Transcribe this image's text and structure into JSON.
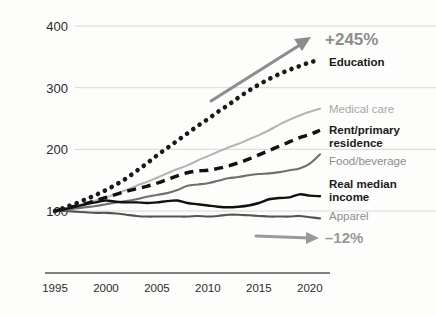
{
  "chart_data": {
    "type": "line",
    "title": "",
    "subtitle": "",
    "xlabel": "",
    "ylabel": "",
    "xlim": [
      1994,
      2022
    ],
    "ylim": [
      60,
      420
    ],
    "xticks": [
      1995,
      2000,
      2005,
      2010,
      2015,
      2020
    ],
    "xtick_labels": [
      "1995",
      "2000",
      "2005",
      "2010",
      "2015",
      "2020"
    ],
    "yticks": [
      100,
      200,
      300,
      400
    ],
    "ytick_labels": [
      "100",
      "200",
      "300",
      "400"
    ],
    "grid": "horizontal",
    "legend_position": "right-inline",
    "index_base": 100,
    "x": [
      1995,
      1996,
      1997,
      1998,
      1999,
      2000,
      2001,
      2002,
      2003,
      2004,
      2005,
      2006,
      2007,
      2008,
      2009,
      2010,
      2011,
      2012,
      2013,
      2014,
      2015,
      2016,
      2017,
      2018,
      2019,
      2020,
      2021
    ],
    "series": [
      {
        "name": "Education",
        "label": "Education",
        "style": "dotted",
        "color": "#1a1a1a",
        "label_color": "#1a1a1a",
        "label_weight": "bold",
        "end_value": 345,
        "values": [
          100,
          106,
          112,
          119,
          126,
          134,
          143,
          153,
          165,
          177,
          190,
          202,
          214,
          226,
          238,
          249,
          261,
          272,
          284,
          295,
          305,
          314,
          322,
          329,
          335,
          341,
          345
        ]
      },
      {
        "name": "Medical care",
        "label": "Medical care",
        "style": "solid",
        "color": "#b5b5b5",
        "label_color": "#a8a8a8",
        "label_weight": "normal",
        "end_value": 266,
        "values": [
          100,
          104,
          108,
          112,
          117,
          122,
          128,
          134,
          141,
          147,
          154,
          161,
          168,
          174,
          182,
          189,
          196,
          203,
          209,
          216,
          223,
          231,
          240,
          248,
          255,
          261,
          266
        ]
      },
      {
        "name": "Rent/primary residence",
        "label": "Rent/primary residence",
        "style": "dashed",
        "color": "#111111",
        "label_color": "#1a1a1a",
        "label_weight": "bold",
        "end_value": 231,
        "values": [
          100,
          104,
          108,
          112,
          117,
          122,
          127,
          132,
          136,
          140,
          145,
          151,
          157,
          162,
          165,
          166,
          169,
          173,
          178,
          184,
          191,
          198,
          205,
          212,
          219,
          224,
          231
        ]
      },
      {
        "name": "Food/beverage",
        "label": "Food/beverage",
        "style": "solid",
        "color": "#6f6f6f",
        "label_color": "#8d8d8d",
        "label_weight": "normal",
        "end_value": 192,
        "values": [
          100,
          102,
          104,
          106,
          108,
          111,
          114,
          116,
          119,
          123,
          126,
          129,
          134,
          141,
          143,
          145,
          149,
          153,
          155,
          158,
          160,
          161,
          163,
          166,
          169,
          177,
          192
        ]
      },
      {
        "name": "Real median income",
        "label": "Real median income",
        "style": "solid",
        "color": "#111111",
        "label_color": "#1a1a1a",
        "label_weight": "bold",
        "end_value": 124,
        "values": [
          100,
          103,
          107,
          111,
          114,
          117,
          115,
          114,
          114,
          113,
          114,
          116,
          117,
          113,
          111,
          109,
          107,
          106,
          107,
          109,
          113,
          119,
          121,
          122,
          127,
          125,
          124
        ]
      },
      {
        "name": "Apparel",
        "label": "Apparel",
        "style": "solid",
        "color": "#555555",
        "label_color": "#8d8d8d",
        "label_weight": "normal",
        "end_value": 88,
        "values": [
          100,
          100,
          99,
          98,
          97,
          97,
          96,
          94,
          92,
          91,
          91,
          91,
          91,
          91,
          92,
          91,
          92,
          94,
          94,
          93,
          92,
          91,
          91,
          91,
          92,
          90,
          88
        ]
      }
    ],
    "annotations": [
      {
        "id": "growth-callout",
        "text": "+245%",
        "color": "#8d8d8d",
        "arrow": "up-right"
      },
      {
        "id": "decline-callout",
        "text": "–12%",
        "color": "#9a9a9a",
        "arrow": "right"
      }
    ]
  },
  "colors": {
    "background": "#fdfdfc",
    "gridline": "#d8d8d8",
    "axis": "#555555",
    "tick_text": "#2b2b2b",
    "arrow": "#8d8d8d"
  }
}
